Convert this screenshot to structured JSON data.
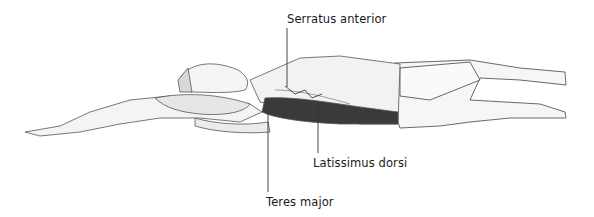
{
  "figure": {
    "labels": [
      {
        "id": "serratus",
        "text": "Serratus anterior"
      },
      {
        "id": "latissimus",
        "text": "Latissimus dorsi"
      },
      {
        "id": "teres",
        "text": "Teres major"
      }
    ],
    "colors": {
      "ink": "#1a1a1a",
      "muscle": "#3a3a3a",
      "skin": "#f4f4f4",
      "line": "#555555"
    }
  }
}
